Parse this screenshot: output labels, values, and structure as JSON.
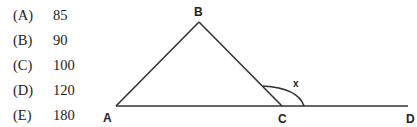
{
  "choices": [
    {
      "label": "(A)",
      "value": "85"
    },
    {
      "label": "(B)",
      "value": "90"
    },
    {
      "label": "(C)",
      "value": "100"
    },
    {
      "label": "(D)",
      "value": "120"
    },
    {
      "label": "(E)",
      "value": "180"
    }
  ],
  "diagram": {
    "points": {
      "A": "A",
      "B": "B",
      "C": "C",
      "D": "D"
    },
    "angle_label": "x"
  }
}
